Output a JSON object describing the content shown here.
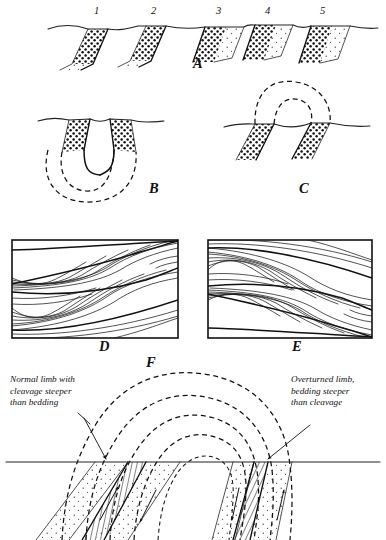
{
  "figure": {
    "background_color": "#ffffff",
    "ink_color": "#111111",
    "width": 386,
    "height": 540
  },
  "panels": [
    {
      "id": "A",
      "letter": "A",
      "letter_x": 193,
      "letter_y": 68,
      "caption": "Graded beds cut by an irregular ground surface; numbers 1-5 mark successive beds",
      "surface_label": "ground-surface-line"
    },
    {
      "id": "B",
      "letter": "B",
      "letter_x": 149,
      "letter_y": 193,
      "caption": "Syncline: bedding traces close downward below the erosion surface",
      "fold_type": "syncline"
    },
    {
      "id": "C",
      "letter": "C",
      "letter_x": 299,
      "letter_y": 193,
      "caption": "Anticline: bedding traces arch upward above the erosion surface",
      "fold_type": "anticline"
    },
    {
      "id": "D",
      "letter": "D",
      "letter_x": 99,
      "letter_y": 351,
      "caption": "Cross-bedding in the right way up, truncated tops at bed boundaries",
      "frame": {
        "x": 12,
        "y": 240,
        "w": 166,
        "h": 98
      }
    },
    {
      "id": "E",
      "letter": "E",
      "letter_x": 292,
      "letter_y": 351,
      "caption": "Cross-bedding inverted, truncated surfaces facing downward",
      "frame": {
        "x": 208,
        "y": 240,
        "w": 164,
        "h": 98
      }
    },
    {
      "id": "F",
      "letter": "F",
      "letter_x": 146,
      "letter_y": 367,
      "caption": "Overturned anticline with cleavage and bedding relations on both limbs",
      "fold_type": "overturned anticline"
    }
  ],
  "bed_numbers": [
    {
      "label": "1",
      "x": 94,
      "y": 14
    },
    {
      "label": "2",
      "x": 151,
      "y": 14
    },
    {
      "label": "3",
      "x": 216,
      "y": 14
    },
    {
      "label": "4",
      "x": 265,
      "y": 14
    },
    {
      "label": "5",
      "x": 320,
      "y": 14
    }
  ],
  "annotations": {
    "left": {
      "name": "normal-limb-annotation",
      "lines": [
        "Normal limb with",
        "cleavage steeper",
        "than bedding"
      ],
      "x": 10,
      "y": 382,
      "line_height": 11.5,
      "leader": {
        "from_x": 84,
        "from_y": 418,
        "to_x": 106,
        "to_y": 461
      }
    },
    "right": {
      "name": "overturned-limb-annotation",
      "lines": [
        "Overturned limb,",
        "bedding steeper",
        "than cleavage"
      ],
      "x": 291,
      "y": 382,
      "line_height": 11.5,
      "leader": {
        "from_x": 308,
        "from_y": 424,
        "to_x": 266,
        "to_y": 460
      }
    }
  },
  "legend_keys": [
    {
      "name": "stipple-pattern",
      "meaning": "sandstone bed, stippled"
    },
    {
      "name": "hatch-pattern",
      "meaning": "cleavage band, ruled lines"
    },
    {
      "name": "dashed-arc",
      "meaning": "eroded continuation of bedding"
    },
    {
      "name": "solid-surface-line",
      "meaning": "present ground surface"
    }
  ]
}
